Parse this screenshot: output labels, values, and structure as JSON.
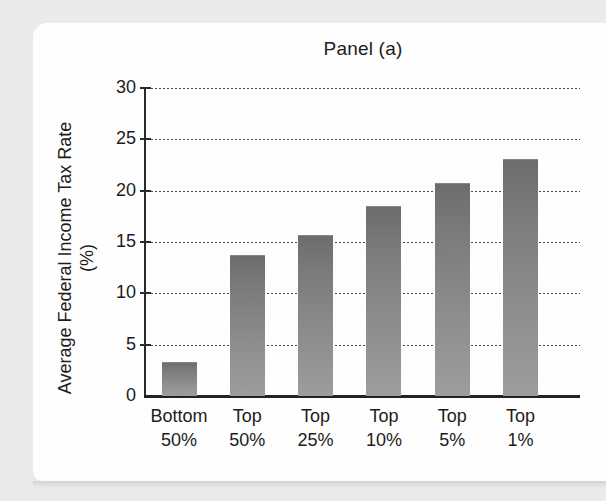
{
  "chart_data": {
    "type": "bar",
    "title": "Panel (a)",
    "xlabel": "",
    "ylabel": "Average Federal Income Tax Rate (%)",
    "ylabel_lines": [
      "Average Federal Income",
      "Tax Rate (%)"
    ],
    "categories": [
      "Bottom 50%",
      "Top 50%",
      "Top 25%",
      "Top 10%",
      "Top 5%",
      "Top 1%"
    ],
    "category_lines": [
      [
        "Bottom",
        "50%"
      ],
      [
        "Top",
        "50%"
      ],
      [
        "Top",
        "25%"
      ],
      [
        "Top",
        "10%"
      ],
      [
        "Top",
        "5%"
      ],
      [
        "Top",
        "1%"
      ]
    ],
    "values": [
      3.3,
      13.7,
      15.7,
      18.5,
      20.7,
      23.1
    ],
    "ylim": [
      0,
      30
    ],
    "yticks": [
      0,
      5,
      10,
      15,
      20,
      25,
      30
    ],
    "ytick_labels": [
      "0",
      "5",
      "10",
      "15",
      "20",
      "25",
      "30"
    ],
    "grid": "horizontal-dotted",
    "legend": null,
    "bar_color_top": "#6d6d6d",
    "bar_color_bottom": "#9e9e9e",
    "axis_color": "#222222",
    "text_color": "#1d1d1d",
    "background": "#ffffff",
    "page_background": "#ececec"
  }
}
